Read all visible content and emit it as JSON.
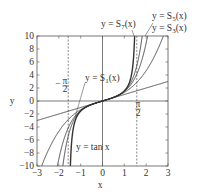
{
  "chart_data": {
    "type": "line",
    "title": "",
    "xlabel": "x",
    "ylabel": "y",
    "xlim": [
      -3,
      3
    ],
    "ylim": [
      -10,
      10
    ],
    "xticks": [
      -3,
      -2,
      -1,
      0,
      1,
      2,
      3
    ],
    "yticks": [
      -10,
      -8,
      -6,
      -4,
      -2,
      0,
      2,
      4,
      6,
      8,
      10
    ],
    "xtick_labels": [
      "−3",
      "−2",
      "−1",
      "0",
      "1",
      "2",
      "3"
    ],
    "ytick_labels": [
      "−10",
      "−8",
      "−6",
      "−4",
      "−2",
      "0",
      "2",
      "4",
      "6",
      "8",
      "10"
    ],
    "grid": false,
    "legend": "none (inline annotations)",
    "series": [
      {
        "name": "y = S1(x)",
        "label": "y = S",
        "sub": "1",
        "suffix": "(x)",
        "formula": "x",
        "coeffs": [
          1
        ]
      },
      {
        "name": "y = S3(x)",
        "label": "y = S",
        "sub": "3",
        "suffix": "(x)",
        "formula": "x + x^3/3",
        "coeffs": [
          1,
          0.333333
        ]
      },
      {
        "name": "y = S5(x)",
        "label": "y = S",
        "sub": "5",
        "suffix": "(x)",
        "formula": "x + x^3/3 + 2x^5/15",
        "coeffs": [
          1,
          0.333333,
          0.133333
        ]
      },
      {
        "name": "y = S7(x)",
        "label": "y = S",
        "sub": "7",
        "suffix": "(x)",
        "formula": "x + x^3/3 + 2x^5/15 + 17x^7/315",
        "coeffs": [
          1,
          0.333333,
          0.133333,
          0.053968
        ]
      },
      {
        "name": "y = tan x",
        "label": "y = tan x",
        "formula": "tan(x)",
        "asymptotes": [
          -1.5708,
          1.5708
        ]
      }
    ],
    "annotations": [
      {
        "text": "−π/2",
        "x": -1.5708,
        "note": "dashed vertical asymptote"
      },
      {
        "text": "π/2",
        "x": 1.5708,
        "note": "dashed vertical asymptote"
      }
    ]
  },
  "labels": {
    "xlabel": "x",
    "ylabel": "y",
    "s1": "y = S",
    "s1_sub": "1",
    "s3": "y = S",
    "s3_sub": "3",
    "s5": "y = S",
    "s5_sub": "5",
    "s7": "y = S",
    "s7_sub": "7",
    "suffix": "(x)",
    "tan": "y = tan x",
    "pi": "π",
    "two": "2",
    "minus": "−"
  },
  "colors": {
    "line": "#333333",
    "axis": "#555555",
    "dashed": "#555555",
    "background": "#ffffff"
  }
}
